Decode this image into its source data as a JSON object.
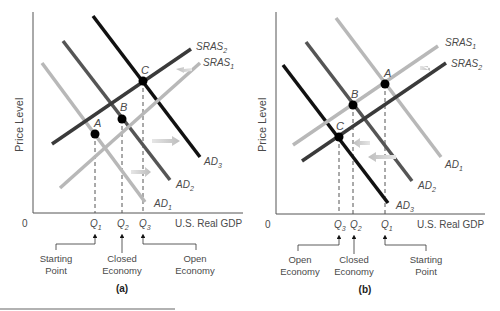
{
  "figure": {
    "panels": [
      {
        "id": "a",
        "caption": "(a)",
        "y_axis_label": "Price Level",
        "x_axis_label": "U.S. Real GDP",
        "origin_label": "0",
        "curves": {
          "AD1": {
            "label": "AD",
            "sub": "1",
            "shade": "#b8b8b8"
          },
          "AD2": {
            "label": "AD",
            "sub": "2",
            "shade": "#555555"
          },
          "AD3": {
            "label": "AD",
            "sub": "3",
            "shade": "#111111"
          },
          "SRAS1": {
            "label": "SRAS",
            "sub": "1",
            "shade": "#b8b8b8"
          },
          "SRAS2": {
            "label": "SRAS",
            "sub": "2",
            "shade": "#3a3a3a"
          }
        },
        "points": {
          "A": "A",
          "B": "B",
          "C": "C"
        },
        "quantities": [
          {
            "label": "Q",
            "sub": "1"
          },
          {
            "label": "Q",
            "sub": "2"
          },
          {
            "label": "Q",
            "sub": "3"
          }
        ],
        "annotations": {
          "starting_line1": "Starting",
          "starting_line2": "Point",
          "closed_line1": "Closed",
          "closed_line2": "Economy",
          "open_line1": "Open",
          "open_line2": "Economy"
        }
      },
      {
        "id": "b",
        "caption": "(b)",
        "y_axis_label": "Price Level",
        "x_axis_label": "U.S. Real GDP",
        "origin_label": "0",
        "curves": {
          "AD1": {
            "label": "AD",
            "sub": "1",
            "shade": "#b8b8b8"
          },
          "AD2": {
            "label": "AD",
            "sub": "2",
            "shade": "#555555"
          },
          "AD3": {
            "label": "AD",
            "sub": "3",
            "shade": "#111111"
          },
          "SRAS1": {
            "label": "SRAS",
            "sub": "1",
            "shade": "#b8b8b8"
          },
          "SRAS2": {
            "label": "SRAS",
            "sub": "2",
            "shade": "#3a3a3a"
          }
        },
        "points": {
          "A": "A",
          "B": "B",
          "C": "C"
        },
        "quantities": [
          {
            "label": "Q",
            "sub": "3"
          },
          {
            "label": "Q",
            "sub": "2"
          },
          {
            "label": "Q",
            "sub": "1"
          }
        ],
        "annotations": {
          "open_line1": "Open",
          "open_line2": "Economy",
          "closed_line1": "Closed",
          "closed_line2": "Economy",
          "starting_line1": "Starting",
          "starting_line2": "Point"
        }
      }
    ]
  }
}
